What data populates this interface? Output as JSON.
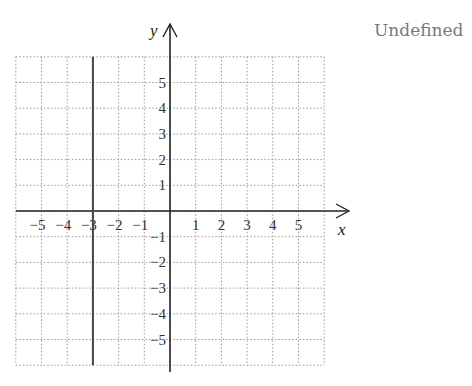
{
  "chart_data": {
    "type": "line",
    "title": "",
    "xlabel": "x",
    "ylabel": "y",
    "xlim": [
      -6,
      6
    ],
    "ylim": [
      -6,
      6
    ],
    "grid": true,
    "grid_style": "dotted",
    "x_tick_labels": [
      "-5",
      "-4",
      "-3",
      "-2",
      "-1",
      "1",
      "2",
      "3",
      "4",
      "5"
    ],
    "y_tick_labels": [
      "5",
      "4",
      "3",
      "2",
      "1",
      "-1",
      "-2",
      "-3",
      "-4",
      "-5"
    ],
    "series": [
      {
        "name": "vertical line x = -3",
        "equation": "x = -3",
        "points": [
          [
            -3,
            -6
          ],
          [
            -3,
            6
          ]
        ]
      }
    ],
    "annotations": [
      "Undefined"
    ]
  },
  "labels": {
    "x_axis": "x",
    "y_axis": "y",
    "slope_answer": "Undefined"
  },
  "colors": {
    "grid": "#999999",
    "axis": "#222222",
    "line": "#444444",
    "answer_text": "#7a7a7a"
  }
}
